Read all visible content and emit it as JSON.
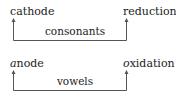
{
  "rows": [
    {
      "left": {
        "first": "c",
        "rest": "athode",
        "italic_first": false
      },
      "right": {
        "first": "r",
        "rest": "eduction",
        "italic_first": false
      },
      "connector_label": "consonants"
    },
    {
      "left": {
        "first": "a",
        "rest": "node",
        "italic_first": true
      },
      "right": {
        "first": "o",
        "rest": "xidation",
        "italic_first": true
      },
      "connector_label": "vowels"
    }
  ],
  "colors": {
    "line": "#555555",
    "text": "#222222",
    "background": "#ffffff"
  }
}
